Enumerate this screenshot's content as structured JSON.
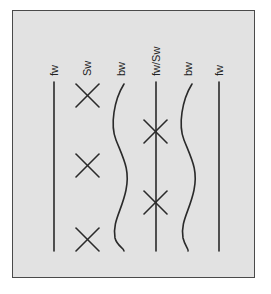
{
  "diagram": {
    "columns": [
      {
        "label": "fw",
        "type": "straight-line",
        "x": 54
      },
      {
        "label": "Sw",
        "type": "crosses",
        "x": 87,
        "crosses_y": [
          95,
          165,
          238
        ]
      },
      {
        "label": "bw",
        "type": "wavy-line",
        "x": 120
      },
      {
        "label": "fw/Sw",
        "type": "straight-line-with-crosses",
        "x": 156,
        "crosses_y": [
          132,
          202
        ]
      },
      {
        "label": "bw",
        "type": "wavy-line",
        "x": 188
      },
      {
        "label": "fw",
        "type": "straight-line",
        "x": 219
      }
    ],
    "colors": {
      "background": "#e2e2e2",
      "stroke": "#2a2a2a",
      "frame": "#4a4a4a"
    }
  }
}
